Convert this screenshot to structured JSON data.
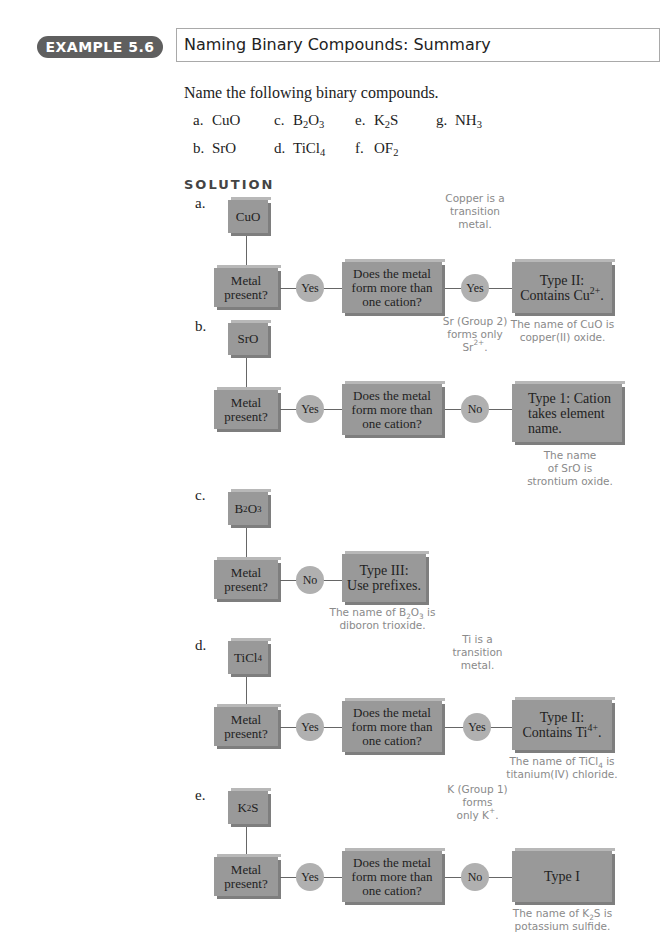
{
  "header": {
    "badge": "EXAMPLE 5.6",
    "title": "Naming Binary Compounds: Summary"
  },
  "prompt": "Name the following binary compounds.",
  "problems": [
    {
      "label": "a.",
      "formula": "CuO"
    },
    {
      "label": "c.",
      "formula": "B2O3"
    },
    {
      "label": "e.",
      "formula": "K2S"
    },
    {
      "label": "g.",
      "formula": "NH3"
    },
    {
      "label": "b.",
      "formula": "SrO"
    },
    {
      "label": "d.",
      "formula": "TiCl4"
    },
    {
      "label": "f.",
      "formula": "OF2"
    }
  ],
  "solution_heading": "SOLUTION",
  "common": {
    "metal_q1": "Metal",
    "metal_q2": "present?",
    "cation_q1": "Does the metal",
    "cation_q2": "form more than",
    "cation_q3": "one cation?",
    "yes": "Yes",
    "no": "No"
  },
  "parts": [
    {
      "label": "a.",
      "compound": "CuO",
      "answer1": "Yes",
      "answer2": "Yes",
      "note": [
        "Copper is a",
        "transition",
        "metal."
      ],
      "result": [
        "Type II:",
        "Contains Cu",
        "2+",
        "."
      ],
      "name": [
        "The name of CuO is",
        "copper(II) oxide."
      ]
    },
    {
      "label": "b.",
      "compound": "SrO",
      "answer1": "Yes",
      "answer2": "No",
      "note": [
        "Sr (Group 2)",
        "forms only",
        "Sr",
        "2+",
        "."
      ],
      "result": [
        "Type 1: Cation",
        "takes element",
        "name."
      ],
      "name": [
        "The name",
        "of SrO is",
        "strontium oxide."
      ]
    },
    {
      "label": "c.",
      "compound": "B2O3",
      "answer1": "No",
      "result": [
        "Type III:",
        "Use prefixes."
      ],
      "name": [
        "The name of B2O3 is",
        "diboron trioxide."
      ]
    },
    {
      "label": "d.",
      "compound": "TiCl4",
      "answer1": "Yes",
      "answer2": "Yes",
      "note": [
        "Ti is a",
        "transition",
        "metal."
      ],
      "result": [
        "Type II:",
        "Contains Ti",
        "4+",
        "."
      ],
      "name": [
        "The name of TiCl4 is",
        "titanium(IV) chloride."
      ]
    },
    {
      "label": "e.",
      "compound": "K2S",
      "answer1": "Yes",
      "answer2": "No",
      "note": [
        "K (Group 1)",
        "forms",
        "only K",
        "+",
        "."
      ],
      "result": [
        "Type I"
      ],
      "name": [
        "The name of K2S is",
        "potassium sulfide."
      ]
    }
  ],
  "colors": {
    "box": "#999999",
    "circle": "#b0b0b0",
    "note_text": "#8a8a8a",
    "badge": "#5f5f5f"
  }
}
